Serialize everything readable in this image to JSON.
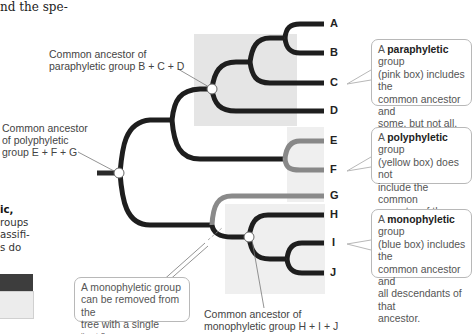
{
  "page_fragments": {
    "top_text": "nd the spe-",
    "side_text": {
      "line1": "ic,",
      "line2": "roups",
      "line3": "assifi-",
      "line4": "s do"
    }
  },
  "tree": {
    "tips": [
      "A",
      "B",
      "C",
      "D",
      "E",
      "F",
      "G",
      "H",
      "I",
      "J"
    ],
    "colors": {
      "branch": "#1e1e1e",
      "polyphyletic_branch": "#8a8a8a",
      "paraphyletic_box": "#e6e6e6",
      "polyphyletic_box": "#efefef",
      "monophyletic_box": "#f0f0f0"
    }
  },
  "node_labels": {
    "paraphyletic": {
      "line1": "Common ancestor of",
      "line2": "paraphyletic group B + C + D"
    },
    "polyphyletic": {
      "line1": "Common ancestor",
      "line2": "of polyphyletic",
      "line3": "group E + F + G"
    },
    "monophyletic": {
      "line1": "Common ancestor of",
      "line2": "monophyletic group H + I + J"
    }
  },
  "callouts": {
    "paraphyletic": {
      "prefix": "A ",
      "term": "paraphyletic",
      "line1_suffix": " group",
      "line2": "(pink box) includes the",
      "line3": "common ancestor and",
      "line4": "some, but not all, of the",
      "line5": "ancestor's decendants."
    },
    "polyphyletic": {
      "prefix": "A ",
      "term": "polyphyletic",
      "line1_suffix": " group",
      "line2": "(yellow box) does not",
      "line3": "include the common",
      "line4": "ancestor of the group."
    },
    "monophyletic": {
      "prefix": "A ",
      "term": "monophyletic",
      "line1_suffix": " group",
      "line2": "(blue box) includes the",
      "line3": "common ancestor and",
      "line4": "all descendants of that",
      "line5": "ancestor."
    },
    "cut": {
      "line1": "A monophyletic group",
      "line2": "can be removed from the",
      "line3": "tree with a single “cut.”"
    }
  }
}
